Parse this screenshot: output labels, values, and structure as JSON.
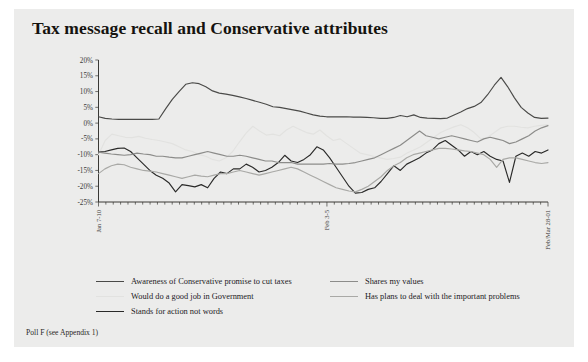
{
  "card": {
    "background": "#ececeb"
  },
  "title": "Tax message recall and Conservative attributes",
  "source_note": "Poll F (see Appendix 1)",
  "legend": {
    "left": [
      {
        "label": "Awareness of Conservative promise to cut taxes",
        "color": "#4a4a48"
      },
      {
        "label": "Would do a good job in Government",
        "color": "#e2e2e0"
      },
      {
        "label": "Stands for action not words",
        "color": "#2a2a29"
      }
    ],
    "right": [
      {
        "label": "Shares my values",
        "color": "#8c8c8a"
      },
      {
        "label": "Has plans to deal with the important problems",
        "color": "#a9a9a6"
      }
    ]
  },
  "chart_data": {
    "type": "line",
    "title": "Tax message recall and Conservative attributes",
    "xlabel": "",
    "ylabel": "",
    "ylim": [
      -25,
      20
    ],
    "ytick_labels": [
      "20%",
      "15%",
      "10%",
      "5%",
      "0%",
      "-5%",
      "-10%",
      "-15%",
      "-20%",
      "-25%"
    ],
    "ytick_values": [
      20,
      15,
      10,
      5,
      0,
      -5,
      -10,
      -15,
      -20,
      -25
    ],
    "grid": false,
    "legend_position": "bottom",
    "x_tick_count": 62,
    "xtick_labels": [
      {
        "index": 0,
        "label": "Jan 7-10"
      },
      {
        "index": 31,
        "label": "Feb 3-5"
      },
      {
        "index": 61,
        "label": "Feb/Mar 28-01"
      }
    ],
    "series": [
      {
        "name": "Awareness of Conservative promise to cut taxes",
        "color": "#4a4a48",
        "values": [
          2.0,
          1.5,
          1.3,
          1.2,
          1.2,
          1.2,
          1.2,
          1.2,
          1.2,
          1.3,
          4.5,
          7.5,
          10.0,
          12.3,
          12.8,
          12.5,
          11.5,
          10.2,
          9.5,
          9.2,
          8.8,
          8.3,
          7.8,
          7.2,
          6.6,
          6.0,
          5.2,
          5.0,
          4.6,
          4.2,
          3.8,
          3.2,
          2.6,
          2.2,
          2.0,
          2.0,
          2.0,
          2.0,
          1.9,
          1.9,
          1.8,
          1.7,
          1.5,
          1.5,
          1.8,
          2.4,
          2.0,
          2.6,
          1.8,
          1.6,
          1.5,
          1.4,
          1.6,
          2.6,
          3.5,
          4.6,
          5.3,
          6.5,
          9.0,
          12.0,
          14.5,
          11.5,
          8.0,
          5.0,
          3.2,
          1.8,
          1.5,
          1.6
        ]
      },
      {
        "name": "Would do a good job in Government",
        "color": "#e2e2e0",
        "values": [
          -10.0,
          -5.5,
          -3.5,
          -4.0,
          -4.5,
          -4.6,
          -4.2,
          -4.8,
          -5.2,
          -5.5,
          -6.0,
          -6.5,
          -7.5,
          -8.5,
          -9.0,
          -10.0,
          -10.5,
          -11.5,
          -12.0,
          -11.0,
          -9.0,
          -6.0,
          -3.2,
          -1.0,
          -2.5,
          -3.8,
          -3.5,
          -4.0,
          -2.2,
          -1.0,
          -2.0,
          -3.0,
          -3.5,
          -2.2,
          -4.0,
          -5.5,
          -5.0,
          -6.5,
          -8.0,
          -9.5,
          -10.0,
          -10.5,
          -11.0,
          -11.5,
          -11.2,
          -10.8,
          -9.5,
          -8.5,
          -7.5,
          -6.0,
          -4.5,
          -3.0,
          -2.0,
          -1.2,
          -0.5,
          -1.5,
          -3.0,
          -5.0,
          -4.5,
          -3.0,
          -1.5,
          -1.0,
          -1.0,
          -1.3,
          -1.5,
          -1.0,
          -0.7,
          -0.5
        ]
      },
      {
        "name": "Stands for action not words",
        "color": "#2a2a29",
        "values": [
          -9.2,
          -9.0,
          -8.5,
          -8.0,
          -7.9,
          -9.0,
          -11.0,
          -13.0,
          -15.0,
          -16.5,
          -17.5,
          -19.0,
          -21.8,
          -19.5,
          -19.8,
          -20.2,
          -19.5,
          -20.5,
          -17.5,
          -15.5,
          -16.0,
          -14.5,
          -14.5,
          -13.0,
          -14.0,
          -15.5,
          -15.0,
          -14.0,
          -12.5,
          -10.2,
          -12.0,
          -12.5,
          -11.5,
          -10.0,
          -7.5,
          -8.5,
          -11.0,
          -14.0,
          -17.0,
          -20.0,
          -22.2,
          -22.0,
          -21.0,
          -20.5,
          -18.5,
          -16.0,
          -13.5,
          -15.0,
          -13.0,
          -12.0,
          -11.0,
          -9.5,
          -8.5,
          -6.5,
          -5.5,
          -7.0,
          -8.5,
          -10.5,
          -9.0,
          -10.0,
          -9.0,
          -10.5,
          -11.5,
          -12.0,
          -18.8,
          -10.5,
          -9.5,
          -10.5,
          -9.0,
          -9.5,
          -8.5
        ]
      },
      {
        "name": "Shares my values",
        "color": "#8c8c8a",
        "values": [
          -9.2,
          -9.5,
          -9.8,
          -10.0,
          -10.2,
          -10.0,
          -9.5,
          -9.8,
          -10.0,
          -10.5,
          -10.5,
          -10.8,
          -11.0,
          -11.0,
          -10.5,
          -10.0,
          -9.5,
          -9.0,
          -9.5,
          -10.0,
          -10.5,
          -10.5,
          -10.2,
          -10.5,
          -11.0,
          -11.5,
          -12.0,
          -12.0,
          -12.5,
          -12.5,
          -12.5,
          -13.0,
          -13.0,
          -13.0,
          -13.0,
          -13.0,
          -12.8,
          -13.0,
          -13.0,
          -12.8,
          -12.5,
          -12.0,
          -11.5,
          -11.0,
          -10.0,
          -9.0,
          -8.0,
          -7.0,
          -5.5,
          -4.0,
          -2.5,
          -4.0,
          -4.5,
          -5.0,
          -4.5,
          -4.0,
          -4.5,
          -5.0,
          -5.5,
          -6.0,
          -5.0,
          -4.5,
          -5.0,
          -5.5,
          -6.5,
          -6.0,
          -5.0,
          -4.0,
          -2.5,
          -1.5,
          -0.8
        ]
      },
      {
        "name": "Has plans to deal with the important problems",
        "color": "#a9a9a6",
        "values": [
          -16.0,
          -14.5,
          -13.5,
          -13.0,
          -13.2,
          -14.0,
          -14.5,
          -15.0,
          -15.2,
          -15.5,
          -16.0,
          -16.5,
          -17.0,
          -17.5,
          -17.0,
          -16.5,
          -16.8,
          -17.0,
          -16.5,
          -16.0,
          -16.0,
          -15.5,
          -15.0,
          -15.5,
          -16.0,
          -16.5,
          -16.0,
          -15.5,
          -15.0,
          -14.5,
          -14.0,
          -14.5,
          -15.5,
          -16.5,
          -17.5,
          -18.5,
          -19.5,
          -20.5,
          -21.0,
          -21.5,
          -21.8,
          -21.0,
          -20.0,
          -18.5,
          -17.0,
          -15.0,
          -13.5,
          -12.5,
          -11.0,
          -10.0,
          -9.5,
          -9.0,
          -8.5,
          -8.0,
          -8.0,
          -8.2,
          -8.5,
          -8.8,
          -9.0,
          -9.5,
          -10.0,
          -11.5,
          -14.0,
          -11.5,
          -11.0,
          -11.0,
          -11.5,
          -12.0,
          -12.5,
          -12.8,
          -12.5
        ]
      }
    ]
  }
}
